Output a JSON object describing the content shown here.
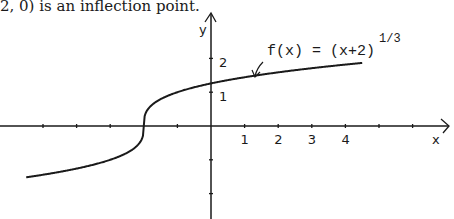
{
  "caption": "2, 0) is an inflection point.",
  "chart_data": {
    "type": "line",
    "title": "",
    "function_label": "f(x) = (x+2)",
    "function_exponent": "1/3",
    "xlabel": "x",
    "ylabel": "y",
    "x_tick_labels": [
      "1",
      "2",
      "3",
      "4"
    ],
    "y_tick_labels": [
      "1",
      "2"
    ],
    "x_ticks": [
      -5,
      -4,
      -3,
      -1,
      1,
      2,
      3,
      4,
      5,
      6
    ],
    "y_ticks": [
      -1,
      -2,
      1,
      2
    ],
    "xlim": [
      -6.3,
      7.2
    ],
    "ylim": [
      -2.8,
      3.3
    ],
    "grid": false,
    "series": [
      {
        "name": "f(x) = (x+2)^(1/3)",
        "x": [
          -5.5,
          -5,
          -4,
          -3,
          -2.5,
          -2.2,
          -2.05,
          -2,
          -1.95,
          -1.8,
          -1.5,
          -1,
          0,
          1,
          2,
          3,
          4,
          4.5
        ],
        "y": [
          -1.52,
          -1.44,
          -1.26,
          -1.0,
          -0.79,
          -0.58,
          -0.37,
          0,
          0.37,
          0.58,
          0.79,
          1.0,
          1.26,
          1.44,
          1.59,
          1.71,
          1.82,
          1.87
        ]
      }
    ],
    "annotations": [
      {
        "text": "f(x) = (x+2)^(1/3)",
        "arrow_to": [
          1.3,
          1.48
        ]
      }
    ],
    "inflection_point": [
      -2,
      0
    ]
  },
  "colors": {
    "ink": "#1a1a1a",
    "background": "#ffffff"
  }
}
